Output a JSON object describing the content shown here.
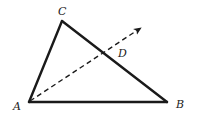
{
  "diagram": {
    "type": "geometry-triangle",
    "colors": {
      "stroke": "#1a1a1a",
      "label": "#222222",
      "background": "#ffffff"
    },
    "points": {
      "A": {
        "label": "A",
        "x": 29,
        "y": 102
      },
      "B": {
        "label": "B",
        "x": 167,
        "y": 102
      },
      "C": {
        "label": "C",
        "x": 62,
        "y": 21
      },
      "D": {
        "label": "D",
        "x": 105,
        "y": 52
      }
    },
    "segments": [
      {
        "from": "A",
        "to": "B",
        "style": "solid"
      },
      {
        "from": "A",
        "to": "C",
        "style": "solid"
      },
      {
        "from": "C",
        "to": "B",
        "style": "solid"
      }
    ],
    "ray": {
      "from": "A",
      "through": "D",
      "style": "dashed",
      "arrow": true,
      "tip": {
        "x": 142,
        "y": 27
      }
    },
    "labels": {
      "A": "A",
      "B": "B",
      "C": "C",
      "D": "D"
    }
  }
}
